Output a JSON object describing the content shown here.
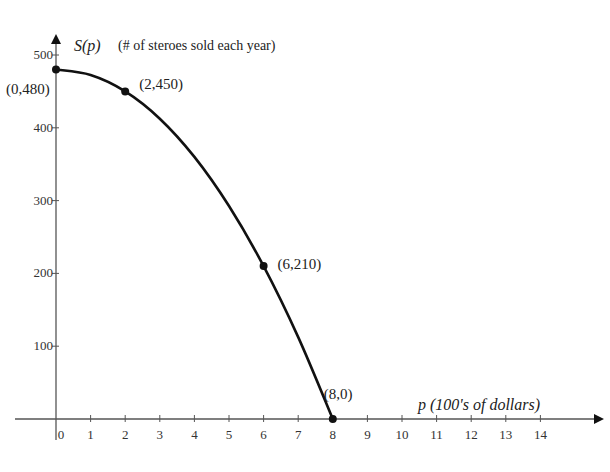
{
  "chart_data": {
    "type": "line",
    "title": "",
    "xlabel": "p (100's of dollars)",
    "ylabel": "S(p) (# of steroes sold each year)",
    "ylabel_func": "S(p)",
    "ylabel_desc": "(# of steroes sold each year)",
    "xlim": [
      0,
      15
    ],
    "ylim": [
      0,
      500
    ],
    "grid": false,
    "legend": null,
    "x_ticks": [
      0,
      1,
      2,
      3,
      4,
      5,
      6,
      7,
      8,
      9,
      10,
      11,
      12,
      13,
      14
    ],
    "y_ticks": [
      100,
      200,
      300,
      400,
      500
    ],
    "series": [
      {
        "name": "S(p)",
        "x": [
          0,
          2,
          6,
          8
        ],
        "values": [
          480,
          450,
          210,
          0
        ],
        "marked_points": [
          {
            "x": 0,
            "y": 480,
            "label": "(0,480)"
          },
          {
            "x": 2,
            "y": 450,
            "label": "(2,450)"
          },
          {
            "x": 6,
            "y": 210,
            "label": "(6,210)"
          },
          {
            "x": 8,
            "y": 0,
            "label": "(8,0)"
          }
        ]
      }
    ],
    "curve_samples": {
      "x": [
        0,
        1,
        2,
        3,
        4,
        5,
        6,
        7,
        8
      ],
      "y": [
        480,
        472.5,
        450,
        412.5,
        360,
        292.5,
        210,
        112.5,
        0
      ]
    },
    "colors": {
      "curve": "#111111",
      "axis": "#555555",
      "text": "#222222"
    }
  }
}
